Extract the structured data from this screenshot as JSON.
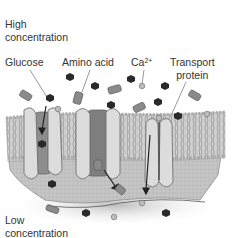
{
  "diagram": {
    "top_label_line1": "High",
    "top_label_line2": "concentration",
    "bottom_label_line1": "Low",
    "bottom_label_line2": "concentration",
    "molecule_labels": {
      "glucose": "Glucose",
      "amino_acid": "Amino acid",
      "calcium_base": "Ca",
      "calcium_sup": "2+",
      "transport_line1": "Transport",
      "transport_line2": "protein"
    },
    "colors": {
      "glucose": "#2a2a2a",
      "amino_acid": "#8a8a8a",
      "calcium": "#a9a9a9",
      "protein": "#d6d6d6",
      "membrane": "#b9b9b9",
      "cytoplasm": "#bdbdbd"
    }
  }
}
